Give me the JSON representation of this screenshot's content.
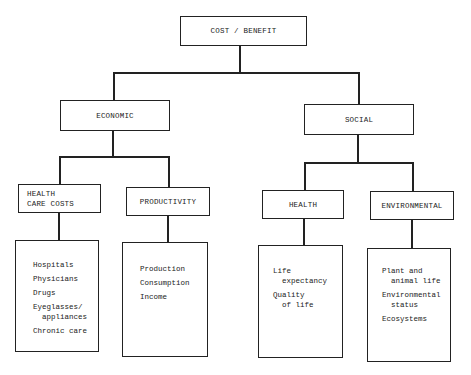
{
  "root": {
    "label": "COST / BENEFIT"
  },
  "branches": [
    {
      "label": "ECONOMIC",
      "children": [
        {
          "label_lines": [
            "HEALTH",
            "CARE COSTS"
          ],
          "items": [
            "Hospitals",
            "Physicians",
            "Drugs",
            "Eyeglasses/\n  appliances",
            "Chronic care"
          ]
        },
        {
          "label_lines": [
            "PRODUCTIVITY"
          ],
          "items": [
            "Production",
            "Consumption",
            "Income"
          ]
        }
      ]
    },
    {
      "label": "SOCIAL",
      "children": [
        {
          "label_lines": [
            "HEALTH"
          ],
          "items": [
            "Life\n  expectancy",
            "Quality\n  of life"
          ]
        },
        {
          "label_lines": [
            "ENVIRONMENTAL"
          ],
          "items": [
            "Plant and\n  animal life",
            "Environmental\n  status",
            "Ecosystems"
          ]
        }
      ]
    }
  ]
}
